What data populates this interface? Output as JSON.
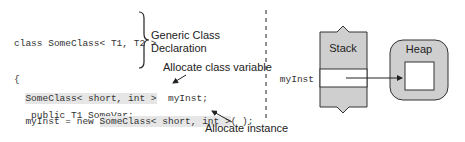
{
  "code": {
    "lines": [
      "class SomeClass< T1, T2 >",
      "{",
      "   public T1 SomeVar;",
      "   public T2 OtherVar;",
      "}",
      "   ..."
    ],
    "decl_hl": "SomeClass< short, int >",
    "decl_rest": "  myInst;",
    "alloc_pre": "myInst = new ",
    "alloc_hl": "SomeClass< short, int >",
    "alloc_post": "( );"
  },
  "annotations": {
    "generic_line1": "Generic Class",
    "generic_line2": "Declaration",
    "alloc_var": "Allocate class variable",
    "alloc_inst": "Allocate instance"
  },
  "memory": {
    "stack_label": "Stack",
    "heap_label": "Heap",
    "var_label": "myInst"
  }
}
